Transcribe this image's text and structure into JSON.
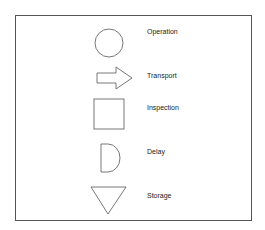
{
  "legend": {
    "items": [
      {
        "symbol": "circle",
        "label": "Operation"
      },
      {
        "symbol": "arrow",
        "label": "Transport"
      },
      {
        "symbol": "square",
        "label": "Inspection"
      },
      {
        "symbol": "d-shape",
        "label": "Delay"
      },
      {
        "symbol": "inverted-triangle",
        "label": "Storage"
      }
    ]
  },
  "colors": {
    "stroke": "#555555",
    "background": "#ffffff",
    "text": "#222222"
  }
}
